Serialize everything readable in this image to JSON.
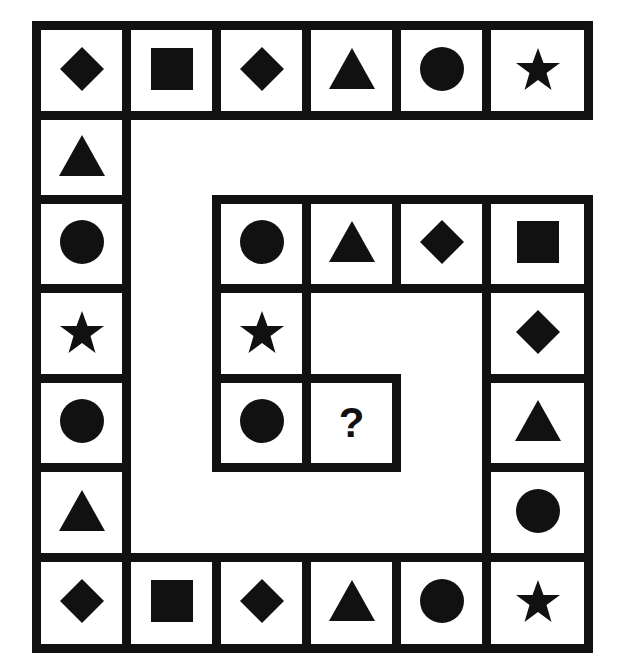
{
  "puzzle": {
    "type": "spiral-sequence",
    "question_mark": "?",
    "colors": {
      "ink": "#111111",
      "background": "#ffffff"
    },
    "cells": [
      {
        "col": 0,
        "row": 0,
        "shape": "diamond"
      },
      {
        "col": 1,
        "row": 0,
        "shape": "square"
      },
      {
        "col": 2,
        "row": 0,
        "shape": "diamond"
      },
      {
        "col": 3,
        "row": 0,
        "shape": "triangle"
      },
      {
        "col": 4,
        "row": 0,
        "shape": "circle"
      },
      {
        "col": 5,
        "row": 0,
        "shape": "star"
      },
      {
        "col": 0,
        "row": 1,
        "shape": "triangle"
      },
      {
        "col": 0,
        "row": 2,
        "shape": "circle"
      },
      {
        "col": 0,
        "row": 3,
        "shape": "star"
      },
      {
        "col": 0,
        "row": 4,
        "shape": "circle"
      },
      {
        "col": 0,
        "row": 5,
        "shape": "triangle"
      },
      {
        "col": 0,
        "row": 6,
        "shape": "diamond"
      },
      {
        "col": 1,
        "row": 6,
        "shape": "square"
      },
      {
        "col": 2,
        "row": 6,
        "shape": "diamond"
      },
      {
        "col": 3,
        "row": 6,
        "shape": "triangle"
      },
      {
        "col": 4,
        "row": 6,
        "shape": "circle"
      },
      {
        "col": 5,
        "row": 6,
        "shape": "star"
      },
      {
        "col": 5,
        "row": 5,
        "shape": "circle"
      },
      {
        "col": 5,
        "row": 4,
        "shape": "triangle"
      },
      {
        "col": 5,
        "row": 3,
        "shape": "diamond"
      },
      {
        "col": 5,
        "row": 2,
        "shape": "square"
      },
      {
        "col": 4,
        "row": 2,
        "shape": "diamond"
      },
      {
        "col": 3,
        "row": 2,
        "shape": "triangle"
      },
      {
        "col": 2,
        "row": 2,
        "shape": "circle"
      },
      {
        "col": 2,
        "row": 3,
        "shape": "star"
      },
      {
        "col": 2,
        "row": 4,
        "shape": "circle"
      },
      {
        "col": 3,
        "row": 4,
        "shape": "question"
      }
    ]
  }
}
